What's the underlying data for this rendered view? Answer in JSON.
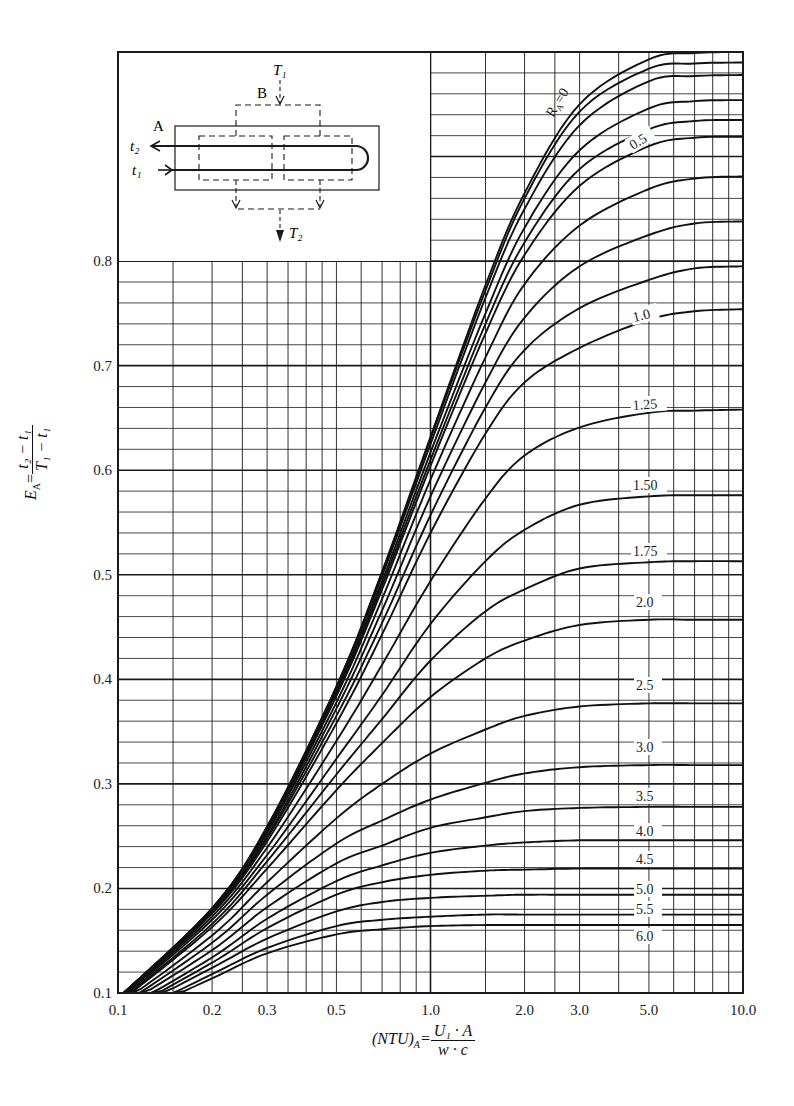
{
  "chart_data": {
    "type": "line",
    "title": "",
    "xlabel": "(NTU)_A = (U1 · A)/(w · c)",
    "ylabel": "E_A = (t2 − t1)/(T1 − t1)",
    "xscale": "log",
    "xlim": [
      0.1,
      10.0
    ],
    "ylim": [
      0.1,
      1.0
    ],
    "grid": true,
    "x_tick_labels": [
      "0.1",
      "0.2",
      "0.3",
      "0.5",
      "1.0",
      "2.0",
      "3.0",
      "5.0",
      "10.0"
    ],
    "x_ticks": [
      0.1,
      0.2,
      0.3,
      0.5,
      1.0,
      2.0,
      3.0,
      5.0,
      10.0
    ],
    "y_tick_labels": [
      "0.1",
      "0.2",
      "0.3",
      "0.4",
      "0.5",
      "0.6",
      "0.7",
      "0.8"
    ],
    "y_ticks": [
      0.1,
      0.2,
      0.3,
      0.4,
      0.5,
      0.6,
      0.7,
      0.8
    ],
    "x": [
      0.1,
      0.2,
      0.3,
      0.5,
      0.7,
      1.0,
      1.5,
      2.0,
      3.0,
      5.0,
      7.0,
      10.0
    ],
    "series": [
      {
        "name": "R_A=0",
        "label": "R_A=0",
        "values": [
          0.095,
          0.181,
          0.259,
          0.393,
          0.503,
          0.632,
          0.777,
          0.865,
          0.95,
          0.993,
          0.999,
          1.0
        ]
      },
      {
        "name": "R_A=0.1",
        "label": "",
        "values": [
          0.095,
          0.181,
          0.259,
          0.393,
          0.502,
          0.63,
          0.772,
          0.86,
          0.943,
          0.984,
          0.989,
          0.99
        ]
      },
      {
        "name": "R_A=0.2",
        "label": "",
        "values": [
          0.095,
          0.181,
          0.258,
          0.391,
          0.499,
          0.625,
          0.765,
          0.85,
          0.93,
          0.972,
          0.977,
          0.978
        ]
      },
      {
        "name": "R_A=0.3",
        "label": "",
        "values": [
          0.095,
          0.18,
          0.257,
          0.388,
          0.494,
          0.617,
          0.75,
          0.832,
          0.906,
          0.946,
          0.953,
          0.954
        ]
      },
      {
        "name": "R_A=0.4",
        "label": "",
        "values": [
          0.095,
          0.18,
          0.256,
          0.386,
          0.49,
          0.61,
          0.74,
          0.818,
          0.888,
          0.926,
          0.934,
          0.935
        ]
      },
      {
        "name": "R_A=0.5",
        "label": "0.5",
        "values": [
          0.095,
          0.18,
          0.255,
          0.384,
          0.486,
          0.604,
          0.731,
          0.806,
          0.872,
          0.91,
          0.918,
          0.919
        ]
      },
      {
        "name": "R_A=0.6",
        "label": "",
        "values": [
          0.095,
          0.179,
          0.253,
          0.378,
          0.477,
          0.591,
          0.708,
          0.778,
          0.834,
          0.869,
          0.879,
          0.881
        ]
      },
      {
        "name": "R_A=0.7",
        "label": "",
        "values": [
          0.094,
          0.178,
          0.25,
          0.372,
          0.466,
          0.575,
          0.684,
          0.746,
          0.795,
          0.825,
          0.836,
          0.838
        ]
      },
      {
        "name": "R_A=0.8",
        "label": "",
        "values": [
          0.094,
          0.177,
          0.248,
          0.365,
          0.454,
          0.557,
          0.66,
          0.715,
          0.755,
          0.782,
          0.793,
          0.795
        ]
      },
      {
        "name": "R_A=1.0",
        "label": "1.0",
        "values": [
          0.094,
          0.176,
          0.245,
          0.358,
          0.443,
          0.54,
          0.635,
          0.684,
          0.717,
          0.744,
          0.752,
          0.754
        ]
      },
      {
        "name": "R_A=1.25",
        "label": "1.25",
        "values": [
          0.093,
          0.173,
          0.239,
          0.341,
          0.414,
          0.494,
          0.573,
          0.614,
          0.641,
          0.655,
          0.657,
          0.658
        ]
      },
      {
        "name": "R_A=1.50",
        "label": "1.50",
        "values": [
          0.092,
          0.17,
          0.232,
          0.324,
          0.385,
          0.453,
          0.513,
          0.543,
          0.567,
          0.575,
          0.576,
          0.576
        ]
      },
      {
        "name": "R_A=1.75",
        "label": "1.75",
        "values": [
          0.091,
          0.166,
          0.226,
          0.309,
          0.362,
          0.418,
          0.465,
          0.486,
          0.506,
          0.512,
          0.513,
          0.513
        ]
      },
      {
        "name": "R_A=2.0",
        "label": "2.0",
        "values": [
          0.09,
          0.163,
          0.219,
          0.294,
          0.339,
          0.383,
          0.42,
          0.437,
          0.452,
          0.457,
          0.457,
          0.457
        ]
      },
      {
        "name": "R_A=2.5",
        "label": "2.5",
        "values": [
          0.088,
          0.155,
          0.206,
          0.267,
          0.3,
          0.329,
          0.352,
          0.365,
          0.374,
          0.377,
          0.377,
          0.377
        ]
      },
      {
        "name": "R_A=3.0",
        "label": "3.0",
        "values": [
          0.086,
          0.148,
          0.194,
          0.243,
          0.265,
          0.285,
          0.301,
          0.31,
          0.316,
          0.318,
          0.318,
          0.318
        ]
      },
      {
        "name": "R_A=3.5",
        "label": "3.5",
        "values": [
          0.084,
          0.141,
          0.182,
          0.224,
          0.241,
          0.258,
          0.268,
          0.274,
          0.277,
          0.278,
          0.278,
          0.278
        ]
      },
      {
        "name": "R_A=4.0",
        "label": "4.0",
        "values": [
          0.081,
          0.134,
          0.171,
          0.207,
          0.222,
          0.234,
          0.241,
          0.244,
          0.246,
          0.246,
          0.246,
          0.246
        ]
      },
      {
        "name": "R_A=4.5",
        "label": "4.5",
        "values": [
          0.079,
          0.129,
          0.162,
          0.194,
          0.206,
          0.213,
          0.217,
          0.218,
          0.219,
          0.219,
          0.219,
          0.219
        ]
      },
      {
        "name": "R_A=5.0",
        "label": "5.0",
        "values": [
          0.077,
          0.124,
          0.152,
          0.178,
          0.187,
          0.191,
          0.193,
          0.194,
          0.194,
          0.194,
          0.194,
          0.194
        ]
      },
      {
        "name": "R_A=5.5",
        "label": "5.5",
        "values": [
          0.074,
          0.118,
          0.143,
          0.164,
          0.17,
          0.173,
          0.175,
          0.175,
          0.175,
          0.175,
          0.175,
          0.175
        ]
      },
      {
        "name": "R_A=6.0",
        "label": "6.0",
        "values": [
          0.073,
          0.114,
          0.138,
          0.156,
          0.161,
          0.164,
          0.165,
          0.165,
          0.165,
          0.165,
          0.165,
          0.165
        ]
      }
    ],
    "annotations": [
      "R_A=0",
      "0.5",
      "1.0",
      "1.25",
      "1.50",
      "1.75",
      "2.0",
      "2.5",
      "3.0",
      "3.5",
      "4.0",
      "4.5",
      "5.0",
      "5.5",
      "6.0"
    ],
    "inset_diagram": {
      "labels": [
        "T1",
        "B",
        "A",
        "t2",
        "t1",
        "T2"
      ],
      "description": "1-shell 2-pass exchanger schematic: tube fluid A enters at t1, exits at t2; shell fluid B enters at T1, exits at T2"
    }
  },
  "axes": {
    "y_label_lhs": "E",
    "y_label_sub": "A",
    "y_label_num": "t₂ − t₁",
    "y_label_den": "T₁ − t₁",
    "x_label_lhs": "(NTU)",
    "x_label_sub": "A",
    "x_label_num": "U₁ · A",
    "x_label_den": "w · c"
  },
  "inset": {
    "T1": "T₁",
    "T2": "T₂",
    "B": "B",
    "A": "A",
    "t2": "t₂",
    "t1": "t₁"
  },
  "colors": {
    "ink": "#1a1a1a",
    "paper": "#ffffff"
  }
}
